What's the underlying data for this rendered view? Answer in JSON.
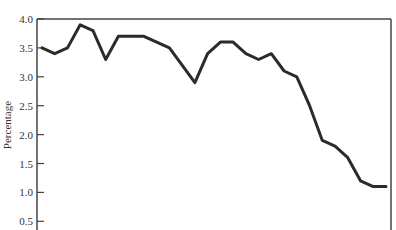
{
  "chart_data": {
    "type": "line",
    "title": "",
    "xlabel": "",
    "ylabel": "Percentage",
    "ylim": [
      0.5,
      4.0
    ],
    "yticks": [
      "4.0",
      "3.5",
      "3.0",
      "2.5",
      "2.0",
      "1.5",
      "1.0",
      "0.5"
    ],
    "grid": false,
    "legend": null,
    "series": [
      {
        "name": "Percentage",
        "color": "#2b2b2b",
        "values": [
          3.5,
          3.4,
          3.5,
          3.9,
          3.8,
          3.3,
          3.7,
          3.7,
          3.7,
          3.6,
          3.5,
          3.2,
          2.9,
          3.4,
          3.6,
          3.6,
          3.4,
          3.3,
          3.4,
          3.1,
          3.0,
          2.5,
          1.9,
          1.8,
          1.6,
          1.2,
          1.1,
          1.1
        ]
      }
    ]
  }
}
